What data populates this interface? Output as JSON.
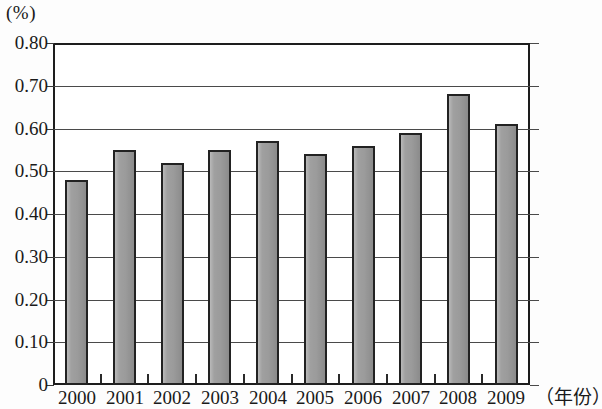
{
  "chart_data": {
    "type": "bar",
    "title": "",
    "subtitle": "",
    "unit_label": "(%)",
    "xlabel": "（年份）",
    "ylabel": "",
    "categories": [
      "2000",
      "2001",
      "2002",
      "2003",
      "2004",
      "2005",
      "2006",
      "2007",
      "2008",
      "2009"
    ],
    "values": [
      0.48,
      0.55,
      0.52,
      0.55,
      0.57,
      0.54,
      0.56,
      0.59,
      0.68,
      0.61
    ],
    "ylim": [
      0,
      0.8
    ],
    "ytick_labels": [
      "0.80",
      "0.70",
      "0.60",
      "0.50",
      "0.40",
      "0.30",
      "0.20",
      "0.10",
      "0"
    ],
    "ytick_values": [
      0.8,
      0.7,
      0.6,
      0.5,
      0.4,
      0.3,
      0.2,
      0.1,
      0
    ],
    "grid": "horizontal",
    "legend": "none",
    "bar_color": "#9b9b9b",
    "bar_edge_color": "#222222",
    "axis_color": "#1d1d1d",
    "grid_color": "#4a4a4a"
  }
}
